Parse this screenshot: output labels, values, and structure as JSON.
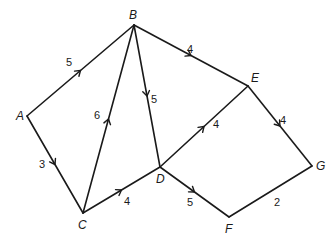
{
  "diagram": {
    "type": "weighted directed network",
    "nodes": [
      {
        "id": "A",
        "label": "A",
        "x": 27,
        "y": 116,
        "lx": 16,
        "ly": 120
      },
      {
        "id": "B",
        "label": "B",
        "x": 134,
        "y": 25,
        "lx": 129,
        "ly": 19
      },
      {
        "id": "C",
        "label": "C",
        "x": 83,
        "y": 213,
        "lx": 78,
        "ly": 229
      },
      {
        "id": "D",
        "label": "D",
        "x": 160,
        "y": 167,
        "lx": 156,
        "ly": 183
      },
      {
        "id": "E",
        "label": "E",
        "x": 248,
        "y": 86,
        "lx": 251,
        "ly": 82
      },
      {
        "id": "F",
        "label": "F",
        "x": 229,
        "y": 217,
        "lx": 225,
        "ly": 233
      },
      {
        "id": "G",
        "label": "G",
        "x": 312,
        "y": 166,
        "lx": 316,
        "ly": 170
      }
    ],
    "edges": [
      {
        "from": "A",
        "to": "B",
        "weight": "5",
        "directed": true,
        "wx": 69,
        "wy": 66
      },
      {
        "from": "A",
        "to": "C",
        "weight": "3",
        "directed": true,
        "wx": 42,
        "wy": 168
      },
      {
        "from": "C",
        "to": "B",
        "weight": "6",
        "directed": true,
        "wx": 97,
        "wy": 119
      },
      {
        "from": "B",
        "to": "D",
        "weight": "5",
        "directed": true,
        "wx": 154,
        "wy": 103
      },
      {
        "from": "B",
        "to": "E",
        "weight": "4",
        "directed": true,
        "wx": 190,
        "wy": 53
      },
      {
        "from": "C",
        "to": "D",
        "weight": "4",
        "directed": true,
        "wx": 127,
        "wy": 205
      },
      {
        "from": "D",
        "to": "E",
        "weight": "4",
        "directed": true,
        "wx": 249,
        "wy": 170,
        "wx2": 216,
        "wy2": 128
      },
      {
        "from": "D",
        "to": "F",
        "weight": "5",
        "directed": true,
        "wx": 190,
        "wy": 206
      },
      {
        "from": "E",
        "to": "G",
        "weight": "4",
        "directed": true,
        "wx": 283,
        "wy": 124
      },
      {
        "from": "F",
        "to": "G",
        "weight": "2",
        "directed": false,
        "wx": 277,
        "wy": 206
      }
    ]
  }
}
